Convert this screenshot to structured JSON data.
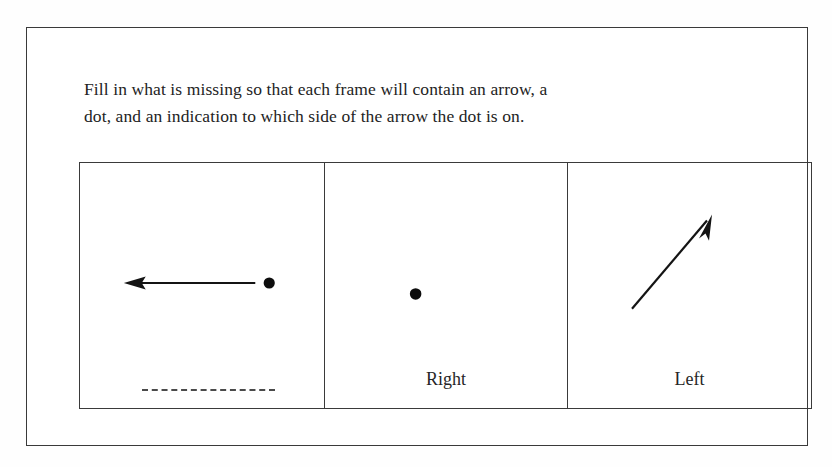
{
  "page": {
    "background_color": "#ffffff",
    "border_color": "#3a3a3a"
  },
  "instruction": {
    "line1": "Fill in what is missing so that each frame will contain an arrow, a",
    "line2": "dot, and an indication to which side of the arrow the dot is on."
  },
  "frames": [
    {
      "id": "frame-1",
      "arrow": {
        "present": true,
        "direction": "left",
        "description": "horizontal arrow pointing left"
      },
      "dot": {
        "present": true,
        "position": "right-of-arrow-tail"
      },
      "label": {
        "present": false,
        "text": "",
        "blank_line": true
      }
    },
    {
      "id": "frame-2",
      "arrow": {
        "present": false,
        "direction": "",
        "description": "missing arrow"
      },
      "dot": {
        "present": true,
        "position": "center"
      },
      "label": {
        "present": true,
        "text": "Right",
        "blank_line": false
      }
    },
    {
      "id": "frame-3",
      "arrow": {
        "present": true,
        "direction": "up-right",
        "description": "diagonal arrow pointing up and to the right"
      },
      "dot": {
        "present": false,
        "position": ""
      },
      "label": {
        "present": true,
        "text": "Left",
        "blank_line": false
      }
    }
  ],
  "colors": {
    "ink": "#1a1a1a",
    "line": "#3a3a3a",
    "dash": "#4a4a4a"
  }
}
